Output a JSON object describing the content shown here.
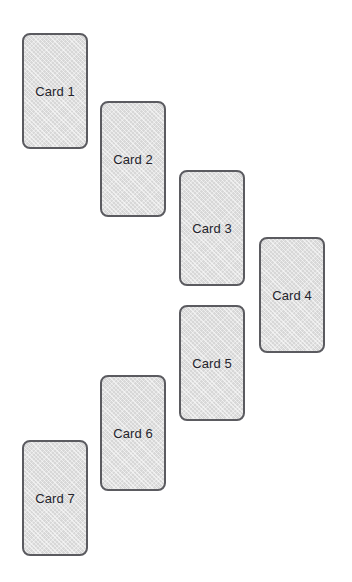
{
  "canvas": {
    "width": 352,
    "height": 582,
    "background_color": "#ffffff"
  },
  "card_style": {
    "width": 66,
    "height": 116,
    "corner_radius": 8,
    "fill_color": "#d7d7d7",
    "border_color": "#5b5b60",
    "border_width": 2,
    "text_color": "#24242c",
    "font_size": 13
  },
  "cards": [
    {
      "label": "Card 1",
      "x": 22,
      "y": 33
    },
    {
      "label": "Card 2",
      "x": 100,
      "y": 101
    },
    {
      "label": "Card 3",
      "x": 179,
      "y": 170
    },
    {
      "label": "Card 4",
      "x": 259,
      "y": 237
    },
    {
      "label": "Card 5",
      "x": 179,
      "y": 305
    },
    {
      "label": "Card 6",
      "x": 100,
      "y": 375
    },
    {
      "label": "Card 7",
      "x": 22,
      "y": 440
    }
  ]
}
